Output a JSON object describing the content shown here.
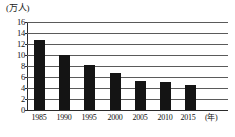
{
  "chart_data": {
    "type": "bar",
    "title": "",
    "subtitle": "",
    "ylabel": "(万人)",
    "xlabel": "(年)",
    "categories": [
      "1985",
      "1990",
      "1995",
      "2000",
      "2005",
      "2010",
      "2015"
    ],
    "values": [
      12.7,
      10.0,
      8.2,
      6.8,
      5.3,
      5.1,
      4.5
    ],
    "series": [
      {
        "name": "",
        "values": [
          12.7,
          10.0,
          8.2,
          6.8,
          5.3,
          5.1,
          4.5
        ]
      }
    ],
    "ylim": [
      0,
      16
    ],
    "ytick_labels": [
      "16",
      "14",
      "12",
      "10",
      "8",
      "6",
      "4",
      "2",
      "0"
    ],
    "ytick_values": [
      16,
      14,
      12,
      10,
      8,
      6,
      4,
      2,
      0
    ],
    "grid": true,
    "grid_axis": "y",
    "legend": false,
    "legend_position": "none",
    "bar_color": "#141414",
    "axis_color": "#2b2b2b",
    "grid_color": "#5a5a5a",
    "annotations": []
  }
}
